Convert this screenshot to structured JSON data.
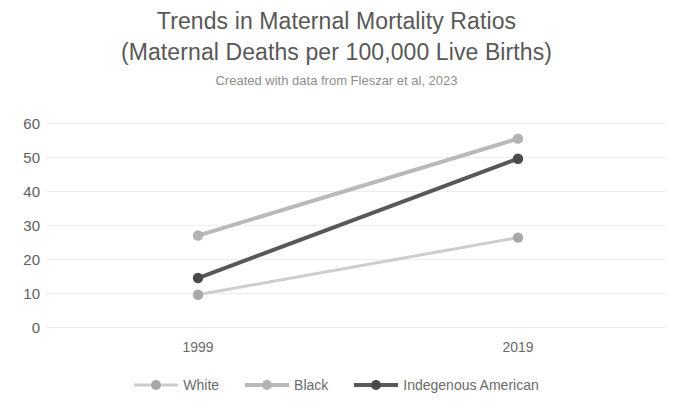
{
  "chart_data": {
    "type": "line",
    "title": "Trends in Maternal Mortality Ratios",
    "title_line1": "Trends in Maternal Mortality Ratios",
    "title_line2": "(Maternal Deaths per 100,000 Live Births)",
    "subtitle": "Created with data from Fleszar et al, 2023",
    "xlabel": "",
    "ylabel": "",
    "x": [
      "1999",
      "2019"
    ],
    "categories": [
      "1999",
      "2019"
    ],
    "xtick_labels": [
      "1999",
      "2019"
    ],
    "ytick_labels": [
      "60",
      "50",
      "40",
      "30",
      "20",
      "10",
      "0"
    ],
    "yticks": [
      60,
      50,
      40,
      30,
      20,
      10,
      0
    ],
    "ylim": [
      0,
      60
    ],
    "grid": true,
    "grid_axis": "y",
    "legend_position": "bottom",
    "series": [
      {
        "name": "White",
        "values": [
          9.5,
          26.3
        ],
        "line_color": "#cdcdcd",
        "marker_color": "#a8a8a8",
        "line_width": 3
      },
      {
        "name": "Black",
        "values": [
          26.9,
          55.4
        ],
        "line_color": "#b9b9b9",
        "marker_color": "#b3b3b3",
        "line_width": 4
      },
      {
        "name": "Indegenous American",
        "values": [
          14.4,
          49.5
        ],
        "line_color": "#585858",
        "marker_color": "#4a4a4a",
        "line_width": 4
      }
    ]
  },
  "colors": {
    "background": "#ffffff",
    "title_text": "#585858",
    "subtitle_text": "#8d8d8d",
    "tick_text": "#5e5e5e",
    "gridline": "#ededed",
    "series_white": "#cdcdcd",
    "series_black": "#b9b9b9",
    "series_indigenous": "#585858"
  }
}
